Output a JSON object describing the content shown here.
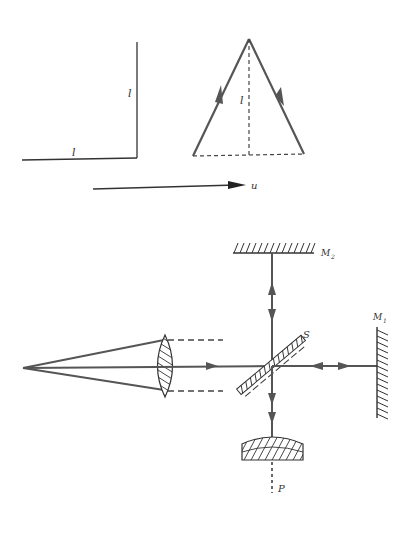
{
  "figure": {
    "colors": {
      "background": "#ffffff",
      "thin_line": "#333333",
      "beam": "#555555",
      "hatch": "#333333"
    },
    "arm_diagram": {
      "vertical_arm_label": "l",
      "horizontal_arm_label": "l"
    },
    "triangle_diagram": {
      "height_label": "l",
      "velocity_label": "u",
      "up_arrow_icon": "arrow-up-right",
      "down_arrow_icon": "arrow-down-right"
    },
    "interferometer": {
      "mirror_top_label": "M",
      "mirror_top_subscript": "2",
      "mirror_right_label": "M",
      "mirror_right_subscript": "1",
      "splitter_label": "S",
      "detector_label": "P"
    }
  }
}
